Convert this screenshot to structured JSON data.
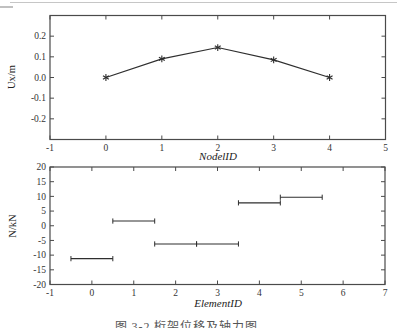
{
  "figure": {
    "caption": "图 3-2  桁架位移及轴力图"
  },
  "chart_data": [
    {
      "type": "line",
      "series_name": "node-x-displacement",
      "xlabel": "NodelID",
      "ylabel": "Ux/m",
      "x": [
        0,
        1,
        2,
        3,
        4
      ],
      "values": [
        0.0,
        0.09,
        0.145,
        0.085,
        0.0
      ],
      "xlim": [
        -1,
        5
      ],
      "ylim": [
        -0.3,
        0.3
      ],
      "xticks": [
        -1,
        0,
        1,
        2,
        3,
        4,
        5
      ],
      "xtick_labels": [
        "-1",
        "0",
        "1",
        "2",
        "3",
        "4",
        "5"
      ],
      "yticks": [
        -0.2,
        -0.1,
        0,
        0.1,
        0.2
      ],
      "ytick_labels": [
        "-0.2",
        "-0.1",
        "0.0",
        "0.1",
        "0.2"
      ],
      "marker": "asterisk",
      "grid": false
    },
    {
      "type": "segments",
      "series_name": "element-axial-force",
      "xlabel": "ElementID",
      "ylabel": "N/kN",
      "segments": [
        {
          "element": 0,
          "x1": -0.5,
          "x2": 0.5,
          "value": -11.2
        },
        {
          "element": 1,
          "x1": 0.5,
          "x2": 1.5,
          "value": 1.6
        },
        {
          "element": 2,
          "x1": 1.5,
          "x2": 2.5,
          "value": -6.2
        },
        {
          "element": 3,
          "x1": 2.5,
          "x2": 3.5,
          "value": -6.2
        },
        {
          "element": 4,
          "x1": 3.5,
          "x2": 4.5,
          "value": 7.8
        },
        {
          "element": 5,
          "x1": 4.5,
          "x2": 5.5,
          "value": 9.7
        }
      ],
      "xlim": [
        -1,
        7
      ],
      "ylim": [
        -20,
        20
      ],
      "xticks": [
        -1,
        0,
        1,
        2,
        3,
        4,
        5,
        6,
        7
      ],
      "xtick_labels": [
        "-1",
        "0",
        "1",
        "2",
        "3",
        "4",
        "5",
        "6",
        "7"
      ],
      "yticks": [
        -20,
        -15,
        -10,
        -5,
        0,
        5,
        10,
        15,
        20
      ],
      "ytick_labels": [
        "-20",
        "-15",
        "-10",
        "-5",
        "0",
        "5",
        "10",
        "15",
        "20"
      ],
      "grid": false
    }
  ],
  "colors": {
    "data_line": "#2e2e2e",
    "frame": "#4a4a4a",
    "tick_text": "#333333",
    "label_text": "#222222",
    "caption_text": "#555555",
    "artifact": "#c6c6c6"
  }
}
